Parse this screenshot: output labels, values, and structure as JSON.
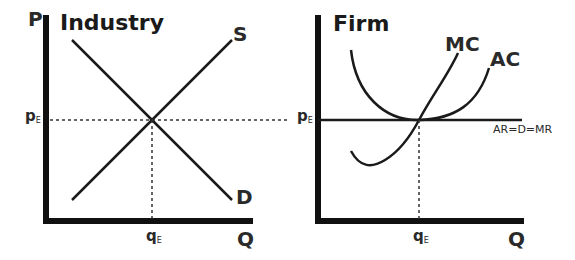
{
  "industry": {
    "title": "Industry",
    "y_axis_label": "P",
    "x_axis_label": "Q",
    "supply_label": "S",
    "demand_label": "D",
    "price_label": "p",
    "price_sub": "E",
    "qty_label": "q",
    "qty_sub": "E"
  },
  "firm": {
    "title": "Firm",
    "x_axis_label": "Q",
    "mc_label": "MC",
    "ac_label": "AC",
    "ar_label": "AR=D=MR",
    "price_label": "p",
    "price_sub": "E",
    "qty_label": "q",
    "qty_sub": "E"
  },
  "colors": {
    "axis": "#111111",
    "curve": "#1a1a1a",
    "dotted": "#333333"
  }
}
